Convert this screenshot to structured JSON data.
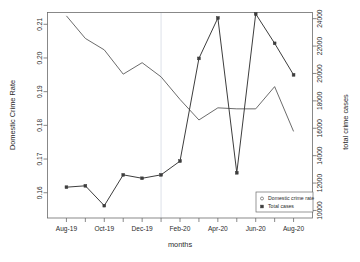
{
  "chart_data": {
    "type": "line",
    "title": "",
    "xlabel": "months",
    "ylabel": "Domestic Crime Rate",
    "y2label": "total crime cases",
    "x": [
      "Aug-19",
      "Sep-19",
      "Oct-19",
      "Nov-19",
      "Dec-19",
      "Jan-20",
      "Feb-20",
      "Mar-20",
      "Apr-20",
      "May-20",
      "Jun-20",
      "Jul-20",
      "Aug-20"
    ],
    "xtick_labels": [
      "Aug-19",
      "Oct-19",
      "Dec-19",
      "Feb-20",
      "Apr-20",
      "Jun-20",
      "Aug-20"
    ],
    "ytick_labels": [
      "0.16",
      "0.17",
      "0.18",
      "0.19",
      "0.20",
      "0.21"
    ],
    "ytick_values": [
      0.16,
      0.17,
      0.18,
      0.19,
      0.2,
      0.21
    ],
    "y2tick_labels": [
      "10000",
      "12000",
      "14000",
      "16000",
      "18000",
      "20000",
      "22000",
      "24000"
    ],
    "y2tick_values": [
      10000,
      12000,
      14000,
      16000,
      18000,
      20000,
      22000,
      24000
    ],
    "ylim": [
      0.1525,
      0.2135
    ],
    "y2lim": [
      9450,
      24450
    ],
    "grid": false,
    "legend_position": "bottom-right",
    "annotations": [
      {
        "type": "vertical-line",
        "x": "Jan-20",
        "color": "#d9dee6"
      }
    ],
    "series": [
      {
        "name": "Domestic crime rate",
        "axis": "left",
        "marker": "open-circle",
        "color": "#5a5a5a",
        "values": [
          0.2125,
          0.2058,
          0.2024,
          0.1952,
          0.1986,
          0.1944,
          0.1877,
          0.1816,
          0.1852,
          0.1849,
          0.1849,
          0.1915,
          0.1782
        ]
      },
      {
        "name": "Total cases",
        "axis": "right",
        "marker": "solid-square",
        "color": "#3d3d3d",
        "values": [
          11700,
          11800,
          10350,
          12600,
          12350,
          12600,
          13600,
          21100,
          24050,
          12750,
          24350,
          22200,
          19900
        ]
      }
    ]
  },
  "legend": {
    "entries": [
      {
        "label": "Domestic crime rate",
        "marker": "open-circle"
      },
      {
        "label": "Total cases",
        "marker": "solid-square"
      }
    ]
  },
  "axes": {
    "left_title": "Domestic Crime Rate",
    "right_title": "total crime cases",
    "bottom_title": "months"
  }
}
